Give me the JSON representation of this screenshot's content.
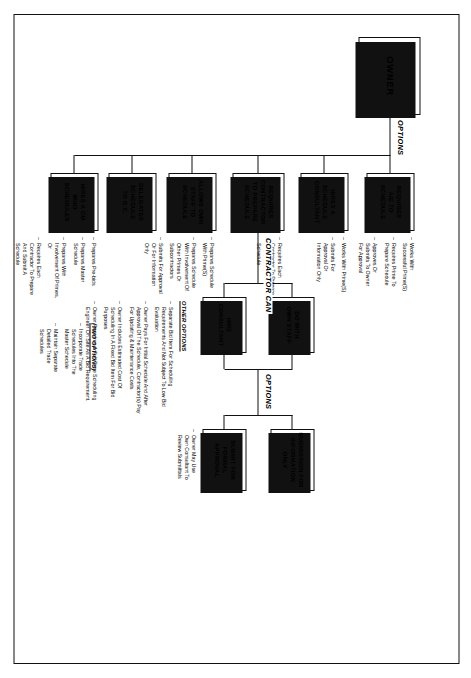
{
  "diagram": {
    "root": {
      "label": "OWNER"
    },
    "flow_labels": {
      "owner_options": "OPTIONS",
      "contractor_can": "CONTRACTOR CAN",
      "submittal_options": "OPTIONS"
    },
    "owner_options": [
      {
        "id": "hires-cm",
        "label": "HIRES A CM\nWHO\nSCHEDULES"
      },
      {
        "id": "delegates-gc",
        "label": "DELEGATES\nSCHEDULE\nTO G.C."
      },
      {
        "id": "allows-own-staff",
        "label": "ALLOWS OWN\nSTAFF TO\nSCHEDULE"
      },
      {
        "id": "requires-contractor",
        "label": "REQUIRES\nCONTRACTOR\nTO PREPARE\nSCHEDULE"
      },
      {
        "id": "hires-consultant",
        "label": "HIRES A\nSCHEDULE\nCONSULTANT"
      },
      {
        "id": "requires-ae",
        "label": "REQUIRES\nA/E TO\nSCHEDULE"
      }
    ],
    "contractor_can_options": [
      {
        "id": "hire-consultant",
        "label": "HIRE\nCONSULTANT"
      },
      {
        "id": "do-with-own-staff",
        "label": "DO WITH\nOWN STAFF"
      }
    ],
    "submittal_options": [
      {
        "id": "submit-formal",
        "label": "SUBMIT FOR\nFORMAL\nAPPROVAL"
      },
      {
        "id": "submission-info",
        "label": "SUBMISSION FOR\nINFORMATION\nONLY"
      }
    ],
    "notes": {
      "hires_cm": [
        "Prepares Pre-bids",
        "Prepares Master\nSchedule",
        "Prepares With\nInvolvement Of Primes,\nOr",
        "Requires Each\nContractor To Prepare\nAnd Submit A\nSchedule"
      ],
      "hires_cm_two_options_title": "(TWO OPTIONS)",
      "hires_cm_two_options": [
        "Incorporate Trade\nSchedules Into The\nMaster Schedule",
        "Maintain Separate\nDetailed Trade\nSchedules"
      ],
      "allows_own_staff": [
        "Prepares Schedule\nWith Prime(S)",
        "Prepares Schedule\nWith Involvement Of\nOther Primes Or\nSubcontractors",
        "Submits For Approval\nOr For Information\nOnly"
      ],
      "requires_contractor": [
        "Requires Each\nContractor To Prepare\nAnd Submit A\nSchedule"
      ],
      "hires_consultant": [
        "Works With Prime(S)",
        "Submits For\nApproval Or\nInformation  Only"
      ],
      "requires_ae": [
        "Works With\nSuccessful Prime(S)",
        "Requires Prime To\nPrepare Schedule",
        "Approves Or\nSubmits To Owner\nFor Approval"
      ],
      "submittal": [
        "Owner May Use\nOwn Consultant To\nReview Submittals"
      ],
      "other_options_title": "OTHER OPTIONS",
      "other_options": [
        "Separate Bid Item For Scheduling\nRequirements And Not Subject To Low Bid\nEvaluation",
        "Owner Pays For Initial Schedule And After\nApproval Of The Schedule, Contractor(s) Pay\nFor Updating & Maintenance Costs",
        "Owner Includes Estimated Cost Of\nScheduling In A Fixed Bid Item For Bid\nPurposes",
        "Owner Requires A Full Time Scheduling\nEngineer On Site As A Bid Requirement."
      ]
    }
  }
}
